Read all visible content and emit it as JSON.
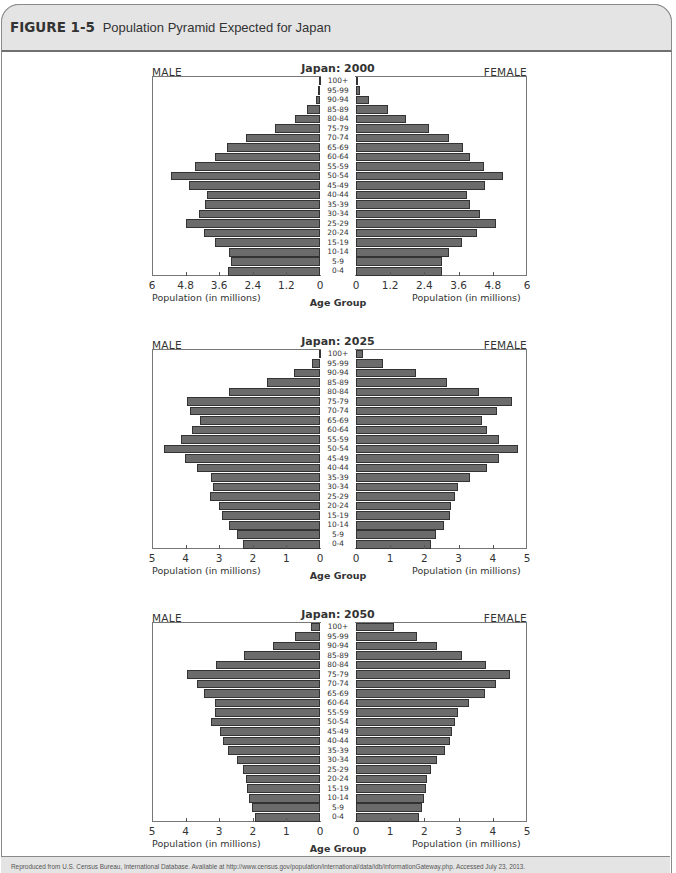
{
  "figure": {
    "label": "FIGURE 1-5",
    "title": "Population Pyramid Expected for Japan"
  },
  "footer": {
    "source": "Reproduced from U.S. Census Bureau, International Database. Available at http://www.census.gov/population/international/data/idb/informationGateway.php. Accessed July 23, 2013."
  },
  "labels": {
    "male": "MALE",
    "female": "FEMALE",
    "xlabel": "Population (in millions)",
    "center_label": "Age Group"
  },
  "chart_data": [
    {
      "type": "bar",
      "subtype": "population-pyramid",
      "title": "Japan: 2000",
      "categories": [
        "100+",
        "95-99",
        "90-94",
        "85-89",
        "80-84",
        "75-79",
        "70-74",
        "65-69",
        "60-64",
        "55-59",
        "50-54",
        "45-49",
        "40-44",
        "35-39",
        "30-34",
        "25-29",
        "20-24",
        "15-19",
        "10-14",
        "5-9",
        "0-4"
      ],
      "xlabel": "Population (in millions)",
      "ylabel": "Age Group",
      "xlim": [
        0,
        6
      ],
      "ticks": [
        "6",
        "4.8",
        "3.6",
        "2.4",
        "1.2",
        "0"
      ],
      "ticks_right": [
        "0",
        "1.2",
        "2.4",
        "3.6",
        "4.8",
        "6"
      ],
      "legend": [
        "MALE",
        "FEMALE"
      ],
      "series": [
        {
          "name": "MALE",
          "values": [
            0.03,
            0.07,
            0.15,
            0.47,
            0.89,
            1.6,
            2.64,
            3.33,
            3.74,
            4.45,
            5.31,
            4.68,
            4.02,
            4.1,
            4.31,
            4.79,
            4.14,
            3.74,
            3.24,
            3.18,
            3.29
          ]
        },
        {
          "name": "FEMALE",
          "values": [
            0.05,
            0.14,
            0.47,
            1.11,
            1.74,
            2.55,
            3.27,
            3.77,
            4.0,
            4.49,
            5.17,
            4.54,
            3.88,
            4.0,
            4.35,
            4.91,
            4.23,
            3.72,
            3.25,
            3.02,
            3.02
          ]
        }
      ]
    },
    {
      "type": "bar",
      "subtype": "population-pyramid",
      "title": "Japan: 2025",
      "categories": [
        "100+",
        "95-99",
        "90-94",
        "85-89",
        "80-84",
        "75-79",
        "70-74",
        "65-69",
        "60-64",
        "55-59",
        "50-54",
        "45-49",
        "40-44",
        "35-39",
        "30-34",
        "25-29",
        "20-24",
        "15-19",
        "10-14",
        "5-9",
        "0-4"
      ],
      "xlabel": "Population (in millions)",
      "ylabel": "Age Group",
      "xlim": [
        0,
        5
      ],
      "ticks": [
        "5",
        "4",
        "3",
        "2",
        "1",
        "0"
      ],
      "ticks_right": [
        "0",
        "1",
        "2",
        "3",
        "4",
        "5"
      ],
      "legend": [
        "MALE",
        "FEMALE"
      ],
      "series": [
        {
          "name": "MALE",
          "values": [
            0.03,
            0.23,
            0.76,
            1.59,
            2.7,
            3.95,
            3.87,
            3.57,
            3.8,
            4.13,
            4.64,
            4.02,
            3.65,
            3.24,
            3.19,
            3.27,
            3.01,
            2.91,
            2.7,
            2.47,
            2.3
          ]
        },
        {
          "name": "FEMALE",
          "values": [
            0.21,
            0.78,
            1.75,
            2.65,
            3.6,
            4.55,
            4.13,
            3.67,
            3.82,
            4.18,
            4.75,
            4.18,
            3.82,
            3.33,
            2.97,
            2.9,
            2.78,
            2.75,
            2.58,
            2.34,
            2.18
          ]
        }
      ]
    },
    {
      "type": "bar",
      "subtype": "population-pyramid",
      "title": "Japan: 2050",
      "categories": [
        "100+",
        "95-99",
        "90-94",
        "85-89",
        "80-84",
        "75-79",
        "70-74",
        "65-69",
        "60-64",
        "55-59",
        "50-54",
        "45-49",
        "40-44",
        "35-39",
        "30-34",
        "25-29",
        "20-24",
        "15-19",
        "10-14",
        "5-9",
        "0-4"
      ],
      "xlabel": "Population (in millions)",
      "ylabel": "Age Group",
      "xlim": [
        0,
        5
      ],
      "ticks": [
        "5",
        "4",
        "3",
        "2",
        "1",
        "0"
      ],
      "ticks_right": [
        "0",
        "1",
        "2",
        "3",
        "4",
        "5"
      ],
      "legend": [
        "MALE",
        "FEMALE"
      ],
      "series": [
        {
          "name": "MALE",
          "values": [
            0.28,
            0.73,
            1.39,
            2.25,
            3.1,
            3.95,
            3.65,
            3.45,
            3.12,
            3.12,
            3.24,
            2.98,
            2.89,
            2.73,
            2.48,
            2.28,
            2.2,
            2.16,
            2.1,
            2.02,
            1.93
          ]
        },
        {
          "name": "FEMALE",
          "values": [
            1.11,
            1.77,
            2.38,
            3.11,
            3.8,
            4.5,
            4.09,
            3.76,
            3.31,
            2.97,
            2.9,
            2.8,
            2.76,
            2.6,
            2.36,
            2.18,
            2.08,
            2.04,
            2.0,
            1.92,
            1.83
          ]
        }
      ]
    }
  ]
}
